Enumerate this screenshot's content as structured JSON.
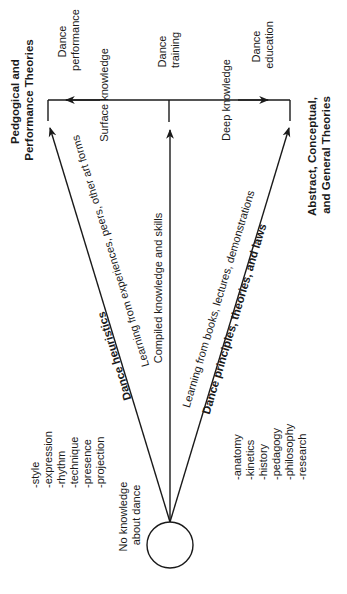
{
  "diagram": {
    "bracket_left": {
      "title_lines": [
        "Pedgogical and",
        "Performance Theories"
      ],
      "outcome_lines": [
        "Dance",
        "performance"
      ],
      "knowledge_label": "Surface knowledge"
    },
    "center": {
      "outcome_lines": [
        "Dance",
        "training"
      ],
      "path_label": "Compiled knowledge and skills"
    },
    "bracket_right": {
      "title_lines": [
        "Abstract, Conceptual,",
        "and General Theories"
      ],
      "outcome_lines": [
        "Dance",
        "education"
      ],
      "knowledge_label": "Deep knowledge"
    },
    "left_path": {
      "bold_label": "Dance heuristics",
      "path_label": "Learning from experiences, peers, other art forms",
      "list": [
        "-style",
        "-expression",
        "-rhythm",
        "-technique",
        "-presence",
        "-projection"
      ]
    },
    "right_path": {
      "bold_label": "Dance principles, theories, and laws",
      "path_label": "Learning from books, lectures, demonstrations",
      "list": [
        "-anatomy",
        "-kinetics",
        "-history",
        "-pedagogy",
        "-philosophy",
        "-research"
      ]
    },
    "origin": {
      "label_lines": [
        "No knowledge",
        "about dance"
      ]
    }
  }
}
